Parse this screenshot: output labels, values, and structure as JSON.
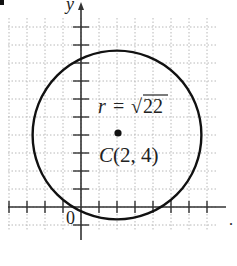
{
  "diagram": {
    "type": "coordinate-plane-circle",
    "marker": "•",
    "axes": {
      "x_label": "x",
      "y_label": "y",
      "origin_label": "0",
      "x_range": [
        -4,
        7
      ],
      "y_range": [
        -1,
        10
      ],
      "tick_spacing": 1,
      "grid": "dotted"
    },
    "circle": {
      "center": {
        "label": "C",
        "x": 2,
        "y": 4
      },
      "center_label": "C(2, 4)",
      "radius_label_prefix": "r =",
      "radius_value": "22",
      "radius_expr": "√22"
    },
    "colors": {
      "stroke": "#111111",
      "grid": "#b8b8b8",
      "axis": "#333333",
      "text": "#222222"
    }
  }
}
